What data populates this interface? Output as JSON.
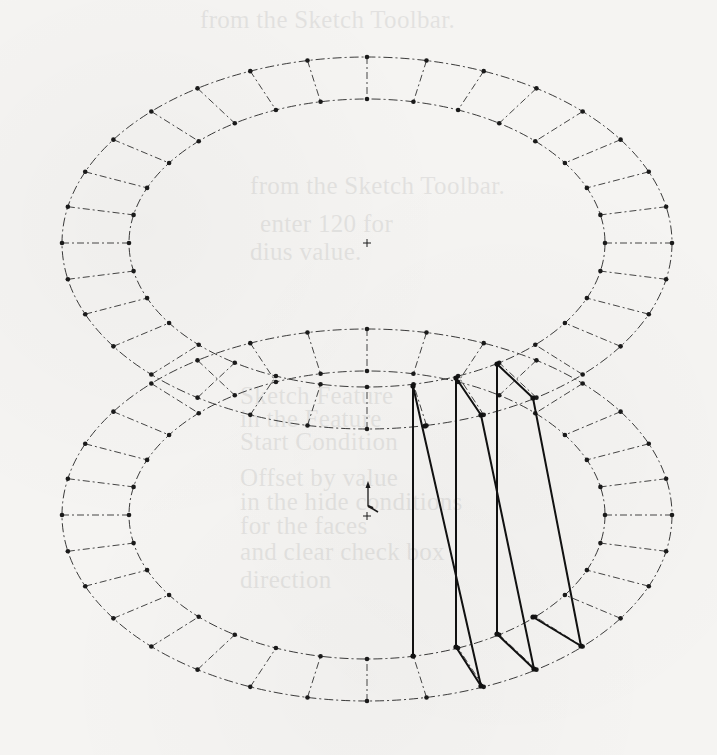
{
  "page": {
    "width": 717,
    "height": 755,
    "background_color": "#f5f4f2",
    "ink_color": "#1a1a1a"
  },
  "ghost_text": {
    "note": "faint bleed-through text from the reverse side of the scanned page",
    "lines": [
      {
        "text": "from the Sketch Toolbar.",
        "x": 200,
        "y": 6
      },
      {
        "text": "from the Sketch Toolbar.",
        "x": 250,
        "y": 172
      },
      {
        "text": "enter 120 for",
        "x": 260,
        "y": 210
      },
      {
        "text": "dius value.",
        "x": 250,
        "y": 238
      },
      {
        "text": "Sketch Feature",
        "x": 240,
        "y": 382
      },
      {
        "text": "in the Feature",
        "x": 240,
        "y": 405
      },
      {
        "text": "Start Condition",
        "x": 240,
        "y": 428
      },
      {
        "text": "Offset by value",
        "x": 240,
        "y": 464
      },
      {
        "text": "in the hide conditions",
        "x": 240,
        "y": 488
      },
      {
        "text": "for the faces",
        "x": 240,
        "y": 512
      },
      {
        "text": "and clear check box",
        "x": 240,
        "y": 538
      },
      {
        "text": "direction",
        "x": 240,
        "y": 566
      }
    ]
  },
  "diagram": {
    "rings": [
      {
        "name": "top-ring",
        "cx": 367,
        "cy": 243,
        "outer": {
          "rx": 305,
          "ry": 186
        },
        "inner": {
          "rx": 238,
          "ry": 144
        },
        "tick_count": 32
      },
      {
        "name": "bottom-ring",
        "cx": 367,
        "cy": 515,
        "outer": {
          "rx": 305,
          "ry": 186
        },
        "inner": {
          "rx": 238,
          "ry": 144
        },
        "tick_count": 32
      }
    ],
    "center_marks": [
      {
        "name": "top-center-cross",
        "x": 367,
        "y": 243
      },
      {
        "name": "bottom-center-cross",
        "x": 367,
        "y": 516
      }
    ],
    "axis_triad": {
      "x": 368,
      "y": 506
    },
    "panel_lines": [
      {
        "name": "panel-a-vertical",
        "x1": 413,
        "y1": 386,
        "x2": 413,
        "y2": 656
      },
      {
        "name": "panel-a-diagonal",
        "x1": 413,
        "y1": 386,
        "x2": 481,
        "y2": 686
      },
      {
        "name": "panel-b-vertical",
        "x1": 456,
        "y1": 378,
        "x2": 456,
        "y2": 647
      },
      {
        "name": "panel-b-top-edge",
        "x1": 456,
        "y1": 378,
        "x2": 481,
        "y2": 415
      },
      {
        "name": "panel-b-diagonal",
        "x1": 481,
        "y1": 415,
        "x2": 534,
        "y2": 669
      },
      {
        "name": "panel-b-bottom-edge",
        "x1": 456,
        "y1": 647,
        "x2": 481,
        "y2": 686
      },
      {
        "name": "panel-c-vertical",
        "x1": 497,
        "y1": 364,
        "x2": 497,
        "y2": 634
      },
      {
        "name": "panel-c-top-edge",
        "x1": 497,
        "y1": 364,
        "x2": 533,
        "y2": 398
      },
      {
        "name": "panel-c-diagonal",
        "x1": 533,
        "y1": 398,
        "x2": 581,
        "y2": 646
      },
      {
        "name": "panel-c-bottom-edge",
        "x1": 497,
        "y1": 634,
        "x2": 534,
        "y2": 669
      },
      {
        "name": "panel-c-base-edge",
        "x1": 533,
        "y1": 617,
        "x2": 581,
        "y2": 646
      }
    ],
    "panel_vertices": [
      [
        413,
        386
      ],
      [
        413,
        656
      ],
      [
        425,
        426
      ],
      [
        481,
        686
      ],
      [
        456,
        378
      ],
      [
        456,
        647
      ],
      [
        481,
        415
      ],
      [
        534,
        669
      ],
      [
        497,
        364
      ],
      [
        497,
        634
      ],
      [
        533,
        398
      ],
      [
        581,
        646
      ],
      [
        533,
        617
      ]
    ]
  }
}
